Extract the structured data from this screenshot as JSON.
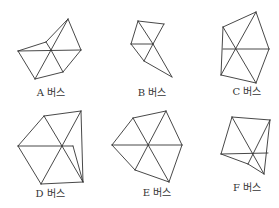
{
  "figure": {
    "line_color": "#333333",
    "shapes": [
      {
        "id": "A",
        "label": "A 버스",
        "vertices": {
          "apex": [
            68,
            19
          ],
          "left": [
            18,
            51
          ],
          "upper": [
            46,
            42
          ],
          "center": [
            51,
            50
          ],
          "right": [
            81,
            50
          ],
          "bottom_left": [
            35,
            79
          ],
          "bottom_right": [
            63,
            72
          ]
        },
        "edges": [
          [
            "left",
            "upper"
          ],
          [
            "upper",
            "apex"
          ],
          [
            "apex",
            "right"
          ],
          [
            "right",
            "bottom_right"
          ],
          [
            "bottom_right",
            "bottom_left"
          ],
          [
            "bottom_left",
            "left"
          ],
          [
            "left",
            "right"
          ],
          [
            "upper",
            "center"
          ],
          [
            "apex",
            "center"
          ],
          [
            "center",
            "bottom_left"
          ],
          [
            "center",
            "bottom_right"
          ]
        ]
      },
      {
        "id": "B",
        "label": "B 버스",
        "vertices": {
          "top_left": [
            138,
            21
          ],
          "top_right": [
            164,
            24
          ],
          "left": [
            131,
            44
          ],
          "center": [
            153,
            44
          ],
          "bottom": [
            144,
            61
          ],
          "tip": [
            172,
            77
          ]
        },
        "edges": [
          [
            "top_left",
            "top_right"
          ],
          [
            "top_right",
            "center"
          ],
          [
            "top_left",
            "left"
          ],
          [
            "top_left",
            "center"
          ],
          [
            "left",
            "center"
          ],
          [
            "left",
            "bottom"
          ],
          [
            "center",
            "bottom"
          ],
          [
            "center",
            "tip"
          ],
          [
            "bottom",
            "tip"
          ]
        ]
      },
      {
        "id": "C",
        "label": "C 버스",
        "vertices": {
          "top": [
            256,
            12
          ],
          "upper_left": [
            223,
            27
          ],
          "center": [
            236,
            49
          ],
          "right": [
            269,
            49
          ],
          "left_mid": [
            223,
            49
          ],
          "bottom_left": [
            221,
            75
          ],
          "bottom": [
            256,
            83
          ]
        },
        "edges": [
          [
            "upper_left",
            "top"
          ],
          [
            "top",
            "right"
          ],
          [
            "right",
            "bottom"
          ],
          [
            "bottom",
            "bottom_left"
          ],
          [
            "bottom_left",
            "upper_left"
          ],
          [
            "left_mid",
            "right"
          ],
          [
            "upper_left",
            "bottom"
          ],
          [
            "top",
            "bottom_left"
          ]
        ]
      },
      {
        "id": "D",
        "label": "D 버스",
        "vertices": {
          "top": [
            44,
            116
          ],
          "top_right": [
            81,
            111
          ],
          "left": [
            18,
            146
          ],
          "center": [
            62,
            146
          ],
          "right_mid": [
            73,
            146
          ],
          "bottom_left": [
            41,
            184
          ],
          "bottom_right": [
            83,
            182
          ]
        },
        "edges": [
          [
            "top",
            "top_right"
          ],
          [
            "top",
            "left"
          ],
          [
            "left",
            "bottom_left"
          ],
          [
            "bottom_left",
            "bottom_right"
          ],
          [
            "top_right",
            "bottom_right"
          ],
          [
            "left",
            "right_mid"
          ],
          [
            "top",
            "center"
          ],
          [
            "center",
            "bottom_left"
          ],
          [
            "top_right",
            "center"
          ],
          [
            "center",
            "bottom_right"
          ],
          [
            "right_mid",
            "bottom_right"
          ]
        ]
      },
      {
        "id": "E",
        "label": "E 버스",
        "vertices": {
          "top_left": [
            133,
            118
          ],
          "top_right": [
            166,
            111
          ],
          "left": [
            112,
            145
          ],
          "center": [
            148,
            145
          ],
          "right": [
            182,
            145
          ],
          "bottom_left": [
            135,
            170
          ],
          "bottom_right": [
            169,
            182
          ]
        },
        "edges": [
          [
            "top_left",
            "top_right"
          ],
          [
            "top_right",
            "right"
          ],
          [
            "right",
            "bottom_right"
          ],
          [
            "bottom_right",
            "bottom_left"
          ],
          [
            "bottom_left",
            "left"
          ],
          [
            "left",
            "top_left"
          ],
          [
            "left",
            "right"
          ],
          [
            "top_left",
            "bottom_right"
          ],
          [
            "top_right",
            "bottom_left"
          ]
        ]
      },
      {
        "id": "F",
        "label": "F 버스",
        "vertices": {
          "top_left": [
            232,
            117
          ],
          "top_right": [
            270,
            120
          ],
          "left": [
            221,
            154
          ],
          "center": [
            253,
            153
          ],
          "right": [
            268,
            153
          ],
          "bottom_mid": [
            248,
            164
          ],
          "tip": [
            264,
            174
          ]
        },
        "edges": [
          [
            "top_left",
            "top_right"
          ],
          [
            "top_right",
            "tip"
          ],
          [
            "top_left",
            "left"
          ],
          [
            "left",
            "right"
          ],
          [
            "top_left",
            "tip"
          ],
          [
            "top_right",
            "bottom_mid"
          ],
          [
            "left",
            "bottom_mid"
          ],
          [
            "bottom_mid",
            "tip"
          ]
        ]
      }
    ]
  }
}
